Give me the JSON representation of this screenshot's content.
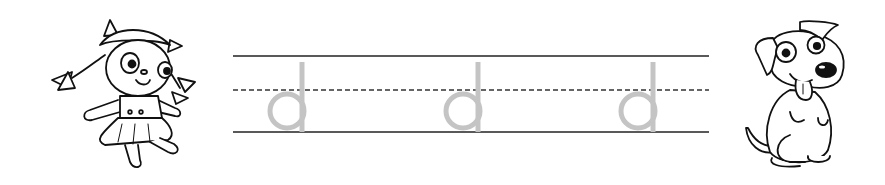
{
  "worksheet": {
    "type": "handwriting-practice",
    "letter": "d",
    "letter_color": "#c4c4c4",
    "line_color": "#222222",
    "letters": [
      {
        "char": "d",
        "stem_x": 302,
        "bowl_cx": 287
      },
      {
        "char": "d",
        "stem_x": 478,
        "bowl_cx": 463
      },
      {
        "char": "d",
        "stem_x": 653,
        "bowl_cx": 638
      }
    ],
    "lines": {
      "x_start": 233,
      "x_end": 709,
      "top_y": 56,
      "mid_y": 90,
      "base_y": 132
    }
  },
  "illustrations": {
    "left": "doll-girl-illustration",
    "right": "puppy-dog-illustration"
  }
}
